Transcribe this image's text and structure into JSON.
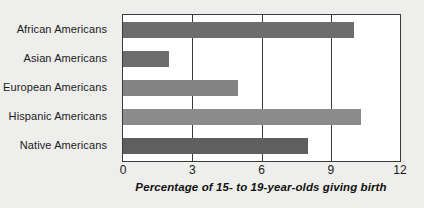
{
  "chart_data": {
    "type": "bar",
    "orientation": "horizontal",
    "title": "",
    "xlabel": "Percentage of 15- to 19-year-olds giving birth",
    "ylabel": "",
    "categories": [
      "African Americans",
      "Asian Americans",
      "European Americans",
      "Hispanic Americans",
      "Native Americans"
    ],
    "values": [
      10.0,
      2.0,
      5.0,
      10.3,
      8.0
    ],
    "bar_colors": [
      "#6d6d6d",
      "#6d6d6d",
      "#848484",
      "#8c8c8c",
      "#5f5f5f"
    ],
    "xlim": [
      0,
      12
    ],
    "xticks": [
      0,
      3,
      6,
      9,
      12
    ],
    "xtick_labels": [
      "0",
      "3",
      "6",
      "9",
      "12"
    ],
    "grid": "vertical",
    "legend": "none",
    "plot_background": "#ffffff",
    "figure_background": "#eeeeec",
    "axis_color": "#3a3a3a"
  }
}
